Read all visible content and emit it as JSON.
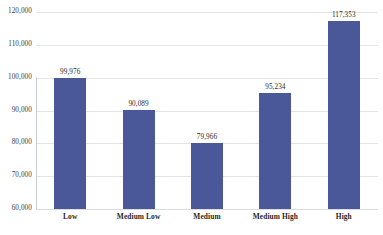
{
  "chart_data": {
    "type": "bar",
    "title": "",
    "subtitle": "",
    "xlabel": "",
    "ylabel": "",
    "categories": [
      "Low",
      "Medium Low",
      "Medium",
      "Medium High",
      "High"
    ],
    "values": [
      99976,
      90089,
      79966,
      95234,
      117353
    ],
    "value_labels": [
      "99,976",
      "90,089",
      "79,966",
      "95,234",
      "117,353"
    ],
    "ylim": [
      60000,
      120000
    ],
    "ytick_values": [
      120000,
      110000,
      100000,
      90000,
      80000,
      70000,
      60000
    ],
    "ytick_labels": [
      "120,000",
      "110,000",
      "100,000",
      "90,000",
      "80,000",
      "70,000",
      "60,000"
    ],
    "grid": "horizontal",
    "legend": "none",
    "series": [
      {
        "name": "",
        "values": [
          99976,
          90089,
          79966,
          95234,
          117353
        ]
      }
    ],
    "colors": {
      "bar": "#4a5899",
      "gridline": "#e4e4e6",
      "axis_line": "#c9cdd6",
      "tick_text": "#3a3a3a",
      "category_text": "#1f1f1f",
      "value_text": "#2b2b2b",
      "background": "#ffffff"
    }
  }
}
